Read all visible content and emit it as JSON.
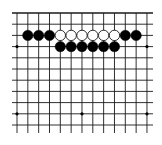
{
  "board": {
    "description": "Partial Go board diagram showing the top edge",
    "columns": 13,
    "rows_visible": 11,
    "origin_x": 17,
    "origin_y": 13,
    "spacing_x": 10.83,
    "spacing_y": 11.2,
    "line_left_extent": 12,
    "line_right_extent": 153,
    "line_bottom_extent": 133,
    "top_edge_visible": true,
    "colors": {
      "background": "#ffffff",
      "grid": "#1a1a1a",
      "black_stone": "#000000",
      "white_stone_fill": "#ffffff",
      "white_stone_stroke": "#000000",
      "star_point": "#000000"
    },
    "star_points": [
      {
        "col": 0,
        "row": 3
      },
      {
        "col": 12,
        "row": 3
      },
      {
        "col": 0,
        "row": 9
      },
      {
        "col": 6,
        "row": 9
      },
      {
        "col": 12,
        "row": 9
      }
    ],
    "stones": [
      {
        "color": "black",
        "col": 1,
        "row": 2
      },
      {
        "color": "black",
        "col": 2,
        "row": 2
      },
      {
        "color": "black",
        "col": 3,
        "row": 2
      },
      {
        "color": "white",
        "col": 4,
        "row": 2
      },
      {
        "color": "white",
        "col": 5,
        "row": 2
      },
      {
        "color": "white",
        "col": 6,
        "row": 2
      },
      {
        "color": "white",
        "col": 7,
        "row": 2
      },
      {
        "color": "white",
        "col": 8,
        "row": 2
      },
      {
        "color": "white",
        "col": 9,
        "row": 2
      },
      {
        "color": "black",
        "col": 10,
        "row": 2
      },
      {
        "color": "black",
        "col": 11,
        "row": 2
      },
      {
        "color": "black",
        "col": 4,
        "row": 3
      },
      {
        "color": "black",
        "col": 5,
        "row": 3
      },
      {
        "color": "black",
        "col": 6,
        "row": 3
      },
      {
        "color": "black",
        "col": 7,
        "row": 3
      },
      {
        "color": "black",
        "col": 8,
        "row": 3
      },
      {
        "color": "black",
        "col": 9,
        "row": 3
      }
    ]
  }
}
